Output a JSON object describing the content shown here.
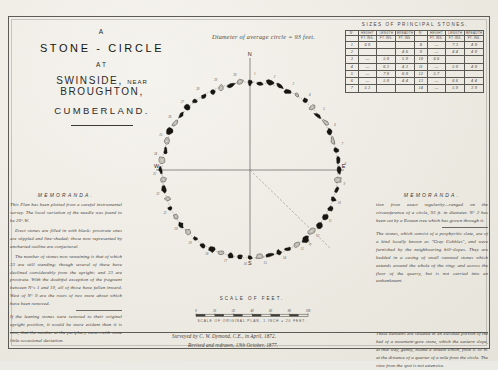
{
  "title_block": {
    "article": "A",
    "main": "STONE - CIRCLE",
    "at": "AT",
    "place_main": "SWINSIDE,",
    "place_small": "NEAR",
    "place_main2": "BROUGHTON,",
    "county": "CUMBERLAND."
  },
  "diameter_note": "Diameter of average circle = 93 feet.",
  "table": {
    "title": "SIZES OF PRINCIPAL STONES.",
    "columns": [
      "N°",
      "HEIGHT",
      "LENGTH",
      "BREADTH",
      "N°",
      "HEIGHT",
      "LENGTH",
      "BREADTH"
    ],
    "unit_header": [
      "",
      "FT. INS.",
      "FT. INS.",
      "FT. INS.",
      "",
      "FT. INS.",
      "FT. INS.",
      "FT. INS."
    ],
    "rows": [
      [
        "1",
        "6 0",
        "",
        "",
        "8",
        "—",
        "7 3",
        "4 0"
      ],
      [
        "2",
        "",
        "",
        "4 6",
        "9",
        "—",
        "4 4",
        "4 0"
      ],
      [
        "3",
        "—",
        "5 0",
        "5 9",
        "10",
        "6 6",
        "",
        ""
      ],
      [
        "4",
        "—",
        "6 3",
        "4 3",
        "11",
        "—",
        "5 0",
        "4 0"
      ],
      [
        "5",
        "—",
        "7 0",
        "6 0",
        "12",
        "5 7",
        "",
        ""
      ],
      [
        "6",
        "—",
        "5 0",
        "4 4",
        "13",
        "—",
        "6 6",
        "4 4"
      ],
      [
        "7",
        "5 3",
        "",
        "",
        "14",
        "—",
        "5 9",
        "3 9"
      ]
    ]
  },
  "memoranda_left": {
    "heading": "MEMORANDA.",
    "paragraphs": [
      "This Plan has been plotted from a careful instrumental survey. The local variation of the needle was found to be 20°.W.",
      "Erect stones are filled in with black: prostrate ones are stippled and line-shaded; those now represented by uncharted outline are conjectural.",
      "The number of stones now remaining is that of which 33 are still standing; though several of these have declined considerably from the upright; and 23 are prostrate. With the doubtful exception of the fragment between N°s 1 and 19, all of those have fallen inward. West of N° 9 are the roots of two more about which have been removed.",
      "If the leaning stones were restored to their original upright position, it would be more evident than it is now, that the number at the periphery were—with some little occasional deviation."
    ]
  },
  "memoranda_right": {
    "heading": "MEMORANDA.",
    "paragraphs": [
      "tion from exact regularity—ranged on the circumference of a circle, 93 ft. in diameter. N° 2 has been cut by a Roman tree which has grown through it.",
      "The stones, which consist of a porphyritic slate, are of a kind locally known as \"Grey Cobbles\", and were furnished by the neighbouring hill-slopes. They are bedded in a casing of small rammed stones which extends around the whole of the ring; and across the floor of the quarry, but is not carried into an embankment.",
      "These Remains are situated in an elevated portion of the bed of a mountain-gore stone, which the eastern slope, at that way, gently, bound a stream which, from S. to W. at the distance of a quarter of a mile from the circle. The view from the spot is not extensive."
    ]
  },
  "plan": {
    "compass": {
      "north": "N",
      "south": "S",
      "east": "E",
      "west": "W"
    },
    "bearing_label": "S. 55° E.",
    "stone_numbers": [
      "1",
      "2",
      "3",
      "4",
      "5",
      "6",
      "7",
      "8",
      "9",
      "10",
      "11",
      "12",
      "13",
      "14",
      "15",
      "16",
      "17",
      "18",
      "19",
      "20",
      "21",
      "22",
      "23",
      "24",
      "25",
      "26",
      "27",
      "28",
      "29",
      "30"
    ]
  },
  "scale": {
    "title": "SCALE OF FEET.",
    "subtitle": "SCALE OF ORIGINAL PLAN, 1 INCH = 20 FEET.",
    "ticks": [
      "0",
      "10",
      "20",
      "40",
      "60",
      "80",
      "100"
    ]
  },
  "credit": {
    "line1": "Surveyed by C. W. Dymond, C.E., in April, 1872.",
    "line2": "Revised and redrawn, 13th October, 1877."
  }
}
